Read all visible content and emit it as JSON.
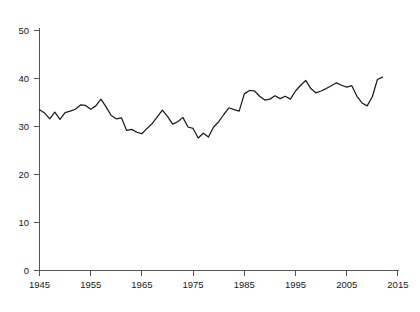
{
  "chart_data": {
    "type": "line",
    "title": "",
    "subtitle": "",
    "xlabel": "",
    "ylabel": "",
    "xlim": [
      1945,
      2015
    ],
    "ylim": [
      0,
      50
    ],
    "grid": false,
    "legend": null,
    "legend_position": "none",
    "x_ticks": [
      "1945",
      "1955",
      "1965",
      "1975",
      "1985",
      "1995",
      "2005",
      "2015"
    ],
    "x_tick_values": [
      1945,
      1955,
      1965,
      1975,
      1985,
      1995,
      2005,
      2015
    ],
    "y_ticks": [
      "0",
      "10",
      "20",
      "30",
      "40",
      "50"
    ],
    "y_tick_values": [
      0,
      10,
      20,
      30,
      40,
      50
    ],
    "line_color": "#1c1c1c",
    "axis_color": "#555555",
    "background_color": "#ffffff",
    "x": [
      1945,
      1946,
      1947,
      1948,
      1949,
      1950,
      1951,
      1952,
      1953,
      1954,
      1955,
      1956,
      1957,
      1958,
      1959,
      1960,
      1961,
      1962,
      1963,
      1964,
      1965,
      1966,
      1967,
      1968,
      1969,
      1970,
      1971,
      1972,
      1973,
      1974,
      1975,
      1976,
      1977,
      1978,
      1979,
      1980,
      1981,
      1982,
      1983,
      1984,
      1985,
      1986,
      1987,
      1988,
      1989,
      1990,
      1991,
      1992,
      1993,
      1994,
      1995,
      1996,
      1997,
      1998,
      1999,
      2000,
      2001,
      2002,
      2003,
      2004,
      2005,
      2006,
      2007,
      2008,
      2009,
      2010,
      2011,
      2012
    ],
    "values": [
      33.5,
      32.8,
      31.6,
      33.0,
      31.5,
      32.9,
      33.2,
      33.6,
      34.5,
      34.4,
      33.6,
      34.3,
      35.7,
      34.1,
      32.3,
      31.6,
      31.8,
      29.2,
      29.4,
      28.8,
      28.5,
      29.6,
      30.6,
      32.0,
      33.4,
      32.1,
      30.5,
      31.0,
      31.9,
      29.9,
      29.6,
      27.6,
      28.6,
      27.8,
      29.9,
      31.0,
      32.5,
      33.9,
      33.5,
      33.2,
      36.8,
      37.5,
      37.4,
      36.3,
      35.5,
      35.7,
      36.4,
      35.8,
      36.3,
      35.7,
      37.4,
      38.6,
      39.6,
      37.9,
      37.0,
      37.4,
      37.9,
      38.5,
      39.1,
      38.6,
      38.2,
      38.5,
      36.3,
      34.9,
      34.3,
      36.2,
      39.8,
      40.3
    ]
  }
}
